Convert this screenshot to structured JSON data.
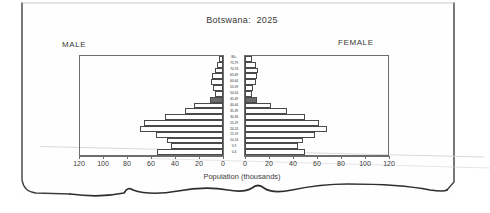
{
  "chart_data": {
    "type": "bar",
    "subtype": "population-pyramid",
    "title": "Botswana:  2025",
    "xlabel": "Population (thousands)",
    "ylabel": "",
    "left_panel_label": "MALE",
    "right_panel_label": "FEMALE",
    "grid": false,
    "legend_position": "none",
    "xlim": [
      0,
      120
    ],
    "xticks": [
      0,
      20,
      40,
      60,
      80,
      100,
      120
    ],
    "left_tick_labels": [
      "120",
      "100",
      "80",
      "60",
      "40",
      "20",
      "0"
    ],
    "right_tick_labels": [
      "0",
      "20",
      "40",
      "60",
      "80",
      "100",
      "120"
    ],
    "categories": [
      "80+",
      "75-79",
      "70-74",
      "65-69",
      "60-64",
      "55-59",
      "50-54",
      "45-49",
      "40-44",
      "35-39",
      "30-34",
      "25-29",
      "20-24",
      "15-19",
      "10-14",
      "5-9",
      "0-4"
    ],
    "series": [
      {
        "name": "MALE",
        "side": "left",
        "values": [
          3,
          5,
          7,
          9,
          10,
          8,
          7,
          11,
          24,
          32,
          48,
          66,
          69,
          56,
          47,
          43,
          55
        ]
      },
      {
        "name": "FEMALE",
        "side": "right",
        "values": [
          6,
          9,
          11,
          10,
          9,
          7,
          6,
          10,
          22,
          35,
          50,
          62,
          68,
          58,
          48,
          44,
          50
        ]
      }
    ],
    "highlighted_category": "45-49",
    "highlight_color": "#6b6b6b",
    "bar_fill_color": "#ffffff",
    "bar_border_color": "#4a4a4a"
  },
  "axis_labels_left": [
    {
      "value": "120",
      "pos": 0
    },
    {
      "value": "100",
      "pos": 20
    },
    {
      "value": "80",
      "pos": 40
    },
    {
      "value": "60",
      "pos": 60
    },
    {
      "value": "40",
      "pos": 80
    },
    {
      "value": "20",
      "pos": 100
    },
    {
      "value": "0",
      "pos": 120
    }
  ],
  "axis_labels_right": [
    {
      "value": "0",
      "pos": 0
    },
    {
      "value": "20",
      "pos": 20
    },
    {
      "value": "40",
      "pos": 40
    },
    {
      "value": "60",
      "pos": 60
    },
    {
      "value": "80",
      "pos": 80
    },
    {
      "value": "100",
      "pos": 100
    },
    {
      "value": "120",
      "pos": 120
    }
  ]
}
